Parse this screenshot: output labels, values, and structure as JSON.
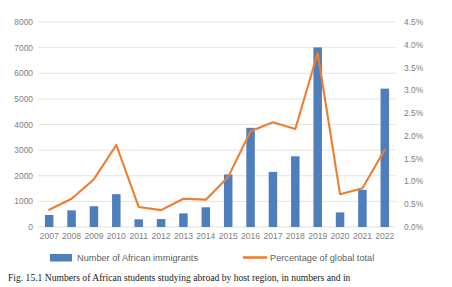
{
  "chart_data": {
    "type": "bar",
    "title": "",
    "subtitle": "",
    "xlabel": "",
    "ylabel": "",
    "categories": [
      "2007",
      "2008",
      "2009",
      "2010",
      "2011",
      "2012",
      "2013",
      "2014",
      "2015",
      "2016",
      "2017",
      "2018",
      "2019",
      "2020",
      "2021",
      "2022"
    ],
    "series": [
      {
        "name": "Number of African immigrants",
        "type": "bar",
        "axis": "left",
        "color": "#4E7EBB",
        "values": [
          470,
          650,
          810,
          1280,
          300,
          310,
          530,
          770,
          2050,
          3870,
          2150,
          2760,
          7010,
          570,
          1450,
          5400
        ]
      },
      {
        "name": "Percentage of global total",
        "type": "line",
        "axis": "right",
        "color": "#ED7D31",
        "values": [
          0.38,
          0.62,
          1.05,
          1.8,
          0.44,
          0.37,
          0.62,
          0.6,
          1.1,
          2.1,
          2.3,
          2.15,
          3.82,
          0.72,
          0.85,
          1.7
        ]
      }
    ],
    "left_axis": {
      "ticks": [
        "0",
        "1000",
        "2000",
        "3000",
        "4000",
        "5000",
        "6000",
        "7000",
        "8000"
      ],
      "min": 0,
      "max": 8000,
      "step": 1000
    },
    "right_axis": {
      "ticks": [
        "0.0%",
        "0.5%",
        "1.0%",
        "1.5%",
        "2.0%",
        "2.5%",
        "3.0%",
        "3.5%",
        "4.0%",
        "4.5%"
      ],
      "min": 0,
      "max": 4.5,
      "step": 0.5
    },
    "grid": true,
    "legend_position": "bottom",
    "legend": [
      {
        "label": "Number of African immigrants",
        "marker": "bar-swatch",
        "color": "#4E7EBB"
      },
      {
        "label": "Percentage of global total",
        "marker": "line-swatch",
        "color": "#ED7D31"
      }
    ]
  },
  "caption": {
    "text": "Fig. 15.1  Numbers of African students studying abroad by host region, in numbers and in"
  }
}
